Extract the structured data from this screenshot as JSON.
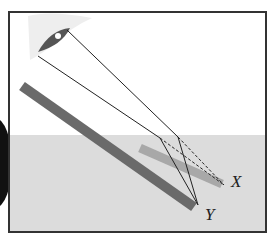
{
  "diagram": {
    "type": "refraction-apparent-depth",
    "labels": {
      "apparent_end": "X",
      "real_end": "Y"
    },
    "colors": {
      "frame": "#333333",
      "water": "#dcdcdc",
      "air": "#ffffff",
      "real_rod": "#6a6a6a",
      "apparent_rod": "#a8a8a8",
      "ray": "#222222"
    }
  }
}
